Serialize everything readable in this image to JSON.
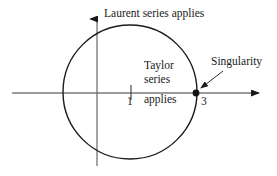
{
  "figure": {
    "title_alt": "Annulus of convergence diagram",
    "background_color": "#ffffff",
    "stroke_color": "#1a1a1a",
    "axes": {
      "x_axis": {
        "label": "",
        "start_x": 12,
        "end_x": 265,
        "y": 93,
        "arrow": "right"
      },
      "y_axis": {
        "label": "",
        "x": 97,
        "start_y": 166,
        "end_y": 12,
        "arrow": "up"
      },
      "origin": {
        "x": 97,
        "y": 93
      }
    },
    "ticks": [
      {
        "name": "tick-1",
        "label": "1",
        "x": 131
      },
      {
        "name": "tick-3",
        "label": "3",
        "x": 196
      }
    ],
    "circle": {
      "center_x": 130,
      "center_y": 92,
      "radius": 67,
      "stroke_width": 1.3
    },
    "singularity_point": {
      "x": 196,
      "y": 93,
      "radius": 3.4
    },
    "annotations": {
      "laurent": "Laurent series applies",
      "taylor_line1": "Taylor",
      "taylor_line2": "series",
      "taylor_line3": "applies",
      "singularity": "Singularity"
    },
    "leader_arrow": {
      "name": "singularity-leader-arrow",
      "from_x": 223,
      "from_y": 71,
      "to_x": 200,
      "to_y": 89
    }
  }
}
